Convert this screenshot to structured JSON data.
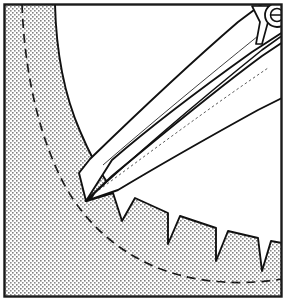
{
  "figure": {
    "width": 286,
    "height": 301,
    "background_color": "#ffffff",
    "border": {
      "color": "#1a1a1a",
      "width": 2,
      "inset": 3
    }
  },
  "colors": {
    "line": "#111111",
    "stipple_dot": "#7a7a7a",
    "stipple_background": "#ffffff",
    "gear_body_fill": "#ffffff",
    "tool_fill": "#ffffff",
    "dashed_line": "#1a1a1a"
  },
  "gear": {
    "name": "ring-gear-segment",
    "description": "Stippled annular gear material occupying the left and bottom of the frame, with trapezoidal teeth projecting inward toward an open white cavity.",
    "pitch_circle": {
      "style": "dashed",
      "dash_pattern": "9 6",
      "stroke_width": 1.6,
      "label": "pitch-circle"
    },
    "root_circle": {
      "style": "solid",
      "stroke_width": 1.8,
      "label": "root-circle"
    },
    "tooth_count_visible": 7,
    "teeth": [
      {
        "index": 1,
        "label": "tooth-1",
        "engaged": true
      },
      {
        "index": 2,
        "label": "tooth-2",
        "engaged": true
      },
      {
        "index": 3,
        "label": "tooth-3",
        "engaged": false
      },
      {
        "index": 4,
        "label": "tooth-4",
        "engaged": false
      },
      {
        "index": 5,
        "label": "tooth-5",
        "engaged": false
      },
      {
        "index": 6,
        "label": "tooth-6",
        "engaged": false
      },
      {
        "index": 7,
        "label": "tooth-7",
        "engaged": false
      }
    ]
  },
  "tool": {
    "name": "caliper-jaws",
    "description": "Two long tapered jaws hinged at a pivot in the upper-right corner, converging to a sharp measuring point that rests in a tooth space.",
    "pivot": {
      "label": "pivot-rivet",
      "cx": 276,
      "cy": 16,
      "r": 11
    },
    "upper_jaw": {
      "label": "upper-jaw"
    },
    "lower_jaw": {
      "label": "lower-jaw"
    },
    "tip": {
      "label": "jaw-tip",
      "x": 86,
      "y": 201
    }
  },
  "caption": ""
}
